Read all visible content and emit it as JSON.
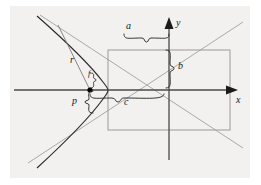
{
  "figure": {
    "background_color": "#f2f1ef",
    "page_color": "#ffffff",
    "panel": {
      "x": 10,
      "y": 6,
      "width": 240,
      "height": 172
    }
  },
  "colors": {
    "axis": "#4a4a4a",
    "curve": "#2a2a2a",
    "asymptote": "#a9a9a9",
    "rectangle": "#9a9a9a",
    "brace": "#2a2a2a",
    "radius": "#6b6b6b",
    "focus_dot": "#000000",
    "label": "#151515"
  },
  "axes": {
    "x_label": "x",
    "y_label": "y",
    "origin": {
      "x": 169,
      "y": 90
    },
    "x_axis": {
      "x1": 14,
      "y1": 90,
      "x2": 234,
      "y2": 90,
      "arrow": "right"
    },
    "y_axis": {
      "x1": 169,
      "y1": 160,
      "x2": 169,
      "y2": 18,
      "arrow": "up"
    }
  },
  "labels": [
    {
      "name": "a",
      "text": "a",
      "x": 126,
      "y": 27,
      "font_size": 10
    },
    {
      "name": "b",
      "text": "b",
      "x": 178,
      "y": 66,
      "font_size": 10
    },
    {
      "name": "c",
      "text": "c",
      "x": 124,
      "y": 95,
      "font_size": 10
    },
    {
      "name": "p",
      "text": "p",
      "x": 63,
      "y": 93,
      "font_size": 10
    },
    {
      "name": "r",
      "text": "r",
      "x": 72,
      "y": 60,
      "font_size": 10
    },
    {
      "name": "f",
      "text": "f",
      "x": 91,
      "y": 69,
      "font_size": 8
    }
  ],
  "braces": [
    {
      "name": "brace-a",
      "measures": "a",
      "orientation": "horizontal-down",
      "from": {
        "x": 108,
        "y": 38
      },
      "to": {
        "x": 169,
        "y": 38
      }
    },
    {
      "name": "brace-b",
      "measures": "b",
      "orientation": "vertical-left",
      "from": {
        "x": 169,
        "y": 50
      },
      "to": {
        "x": 169,
        "y": 90
      }
    },
    {
      "name": "brace-c",
      "measures": "c",
      "orientation": "horizontal-up",
      "from": {
        "x": 90,
        "y": 98
      },
      "to": {
        "x": 169,
        "y": 98
      }
    },
    {
      "name": "brace-p",
      "measures": "p",
      "orientation": "vertical-right",
      "from": {
        "x": 90,
        "y": 90
      },
      "to": {
        "x": 90,
        "y": 113
      }
    },
    {
      "name": "brace-f",
      "measures": "f",
      "orientation": "small-right",
      "from": {
        "x": 90,
        "y": 74
      },
      "to": {
        "x": 90,
        "y": 88
      }
    }
  ],
  "geometry": {
    "rectangle": {
      "x": 108,
      "y": 50,
      "width": 122,
      "height": 80,
      "note": "central rectangle, half-width a, half-height b"
    },
    "focus": {
      "x": 90,
      "y": 90,
      "label": "focus point (left focus)"
    },
    "vertex": {
      "x": 108,
      "y": 90
    },
    "semi_major_a": 61,
    "semi_minor_b": 40,
    "focal_distance_c": 79,
    "asymptote_slope": 0.6557,
    "curve_branch": "left",
    "radius_point": {
      "x": 112,
      "y": 40
    }
  },
  "elements": {
    "x_arrow": "arrow-right",
    "y_arrow": "arrow-up",
    "focus_marker": "filled-dot"
  }
}
